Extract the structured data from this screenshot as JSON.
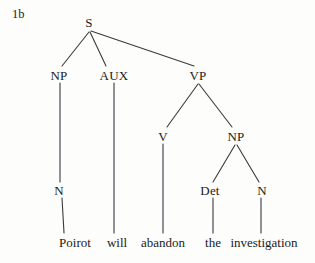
{
  "figure": {
    "example_number": "1b",
    "sentence": "Poirot will abandon the investigation",
    "background_color": "#fdfdfc",
    "line_color": "#3a3a40",
    "text_color": "#1b1c20"
  },
  "nodes": {
    "s": {
      "label": "S",
      "x": 89,
      "y": 22
    },
    "np_subject": {
      "label": "NP",
      "x": 59,
      "y": 75
    },
    "aux": {
      "label": "AUX",
      "x": 114,
      "y": 75
    },
    "vp": {
      "label": "VP",
      "x": 198,
      "y": 75
    },
    "n_subject": {
      "label": "N",
      "x": 59,
      "y": 190
    },
    "v": {
      "label": "V",
      "x": 163,
      "y": 136
    },
    "np_object": {
      "label": "NP",
      "x": 236,
      "y": 136
    },
    "det": {
      "label": "Det",
      "x": 210,
      "y": 190
    },
    "n_object": {
      "label": "N",
      "x": 262,
      "y": 190
    }
  },
  "leaves": [
    {
      "word": "Poirot",
      "x": 75,
      "y": 242,
      "parent": "N"
    },
    {
      "word": "will",
      "x": 117,
      "y": 242,
      "parent": "AUX"
    },
    {
      "word": "abandon",
      "x": 163,
      "y": 242,
      "parent": "V"
    },
    {
      "word": "the",
      "x": 213,
      "y": 242,
      "parent": "Det"
    },
    {
      "word": "investigation",
      "x": 264,
      "y": 242,
      "parent": "N"
    }
  ],
  "edges": [
    {
      "from": "S",
      "to": "NP",
      "x1": 89,
      "y1": 32,
      "x2": 62,
      "y2": 66
    },
    {
      "from": "S",
      "to": "AUX",
      "x1": 90,
      "y1": 32,
      "x2": 106,
      "y2": 66
    },
    {
      "from": "S",
      "to": "VP",
      "x1": 91,
      "y1": 31,
      "x2": 194,
      "y2": 66
    },
    {
      "from": "NP",
      "to": "N",
      "x1": 60,
      "y1": 83,
      "x2": 60,
      "y2": 182
    },
    {
      "from": "N",
      "to": "Poirot",
      "x1": 62,
      "y1": 198,
      "x2": 64,
      "y2": 233
    },
    {
      "from": "AUX",
      "to": "will",
      "x1": 114,
      "y1": 83,
      "x2": 114,
      "y2": 233
    },
    {
      "from": "VP",
      "to": "V",
      "x1": 198,
      "y1": 84,
      "x2": 167,
      "y2": 127
    },
    {
      "from": "VP",
      "to": "NP",
      "x1": 199,
      "y1": 84,
      "x2": 232,
      "y2": 127
    },
    {
      "from": "V",
      "to": "abandon",
      "x1": 163,
      "y1": 144,
      "x2": 163,
      "y2": 233
    },
    {
      "from": "NP",
      "to": "Det",
      "x1": 235,
      "y1": 145,
      "x2": 213,
      "y2": 182
    },
    {
      "from": "NP",
      "to": "N",
      "x1": 237,
      "y1": 145,
      "x2": 259,
      "y2": 182
    },
    {
      "from": "Det",
      "to": "the",
      "x1": 213,
      "y1": 198,
      "x2": 213,
      "y2": 233
    },
    {
      "from": "N",
      "to": "investigation",
      "x1": 261,
      "y1": 198,
      "x2": 261,
      "y2": 233
    }
  ]
}
